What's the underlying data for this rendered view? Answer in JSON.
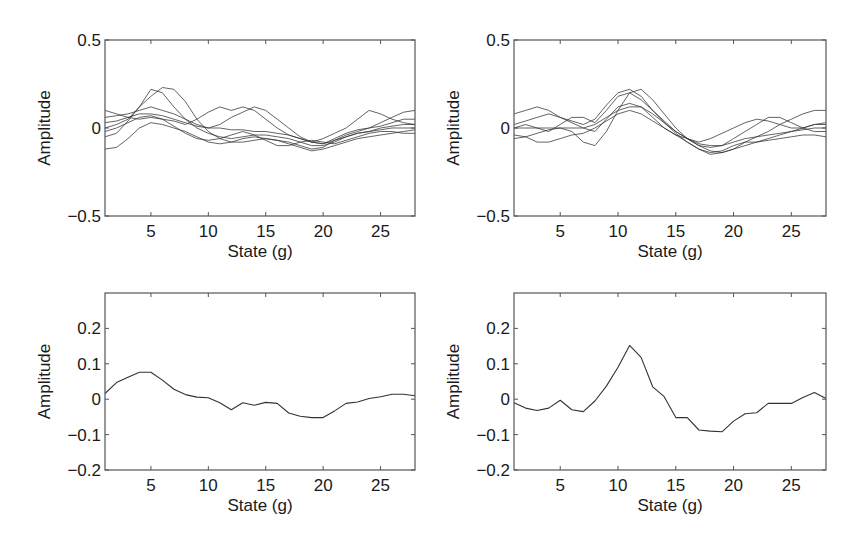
{
  "figure": {
    "panels": [
      {
        "id": "top-left",
        "xlabel": "State (g)",
        "ylabel": "Amplitude"
      },
      {
        "id": "top-right",
        "xlabel": "State (g)",
        "ylabel": "Amplitude"
      },
      {
        "id": "bottom-left",
        "xlabel": "State (g)",
        "ylabel": "Amplitude"
      },
      {
        "id": "bottom-right",
        "xlabel": "State (g)",
        "ylabel": "Amplitude"
      }
    ]
  },
  "chart_data": [
    {
      "type": "line",
      "panel": "top-left",
      "title": "",
      "xlabel": "State (g)",
      "ylabel": "Amplitude",
      "xlim": [
        1,
        28
      ],
      "ylim": [
        -0.5,
        0.5
      ],
      "xticks": [
        5,
        10,
        15,
        20,
        25
      ],
      "yticks": [
        -0.5,
        0,
        0.5
      ],
      "ytick_labels": [
        "−0.5",
        "0",
        "0.5"
      ],
      "grid": false,
      "description": "~25 overlaid individual traces; cluster peaks near state 5 (~0.05-0.22), dips near state 20 (~-0.1)",
      "x": [
        1,
        2,
        3,
        4,
        5,
        6,
        7,
        8,
        9,
        10,
        11,
        12,
        13,
        14,
        15,
        16,
        17,
        18,
        19,
        20,
        21,
        22,
        23,
        24,
        25,
        26,
        27,
        28
      ],
      "series": [
        {
          "name": "trace-1",
          "values": [
            0.03,
            0.04,
            0.06,
            0.08,
            0.08,
            0.07,
            0.05,
            0.03,
            0.01,
            0.0,
            0.0,
            -0.01,
            -0.01,
            -0.02,
            -0.02,
            -0.03,
            -0.04,
            -0.06,
            -0.08,
            -0.09,
            -0.07,
            -0.05,
            -0.03,
            -0.02,
            -0.01,
            0.0,
            0.0,
            0.0
          ]
        },
        {
          "name": "trace-2",
          "values": [
            0.0,
            0.02,
            0.05,
            0.12,
            0.22,
            0.2,
            0.12,
            0.05,
            0.0,
            -0.03,
            -0.05,
            -0.06,
            -0.05,
            -0.04,
            -0.04,
            -0.05,
            -0.06,
            -0.08,
            -0.1,
            -0.1,
            -0.08,
            -0.05,
            -0.03,
            -0.02,
            0.0,
            0.01,
            0.02,
            0.02
          ]
        },
        {
          "name": "trace-3",
          "values": [
            -0.05,
            -0.03,
            0.04,
            0.12,
            0.18,
            0.23,
            0.22,
            0.15,
            0.05,
            -0.02,
            -0.06,
            -0.08,
            -0.08,
            -0.07,
            -0.06,
            -0.07,
            -0.08,
            -0.1,
            -0.12,
            -0.11,
            -0.07,
            -0.04,
            -0.02,
            0.0,
            0.01,
            0.03,
            0.05,
            0.05
          ]
        },
        {
          "name": "trace-4",
          "values": [
            0.1,
            0.08,
            0.06,
            0.05,
            0.06,
            0.05,
            0.04,
            0.02,
            0.05,
            0.09,
            0.12,
            0.1,
            0.12,
            0.1,
            0.05,
            0.0,
            -0.04,
            -0.06,
            -0.08,
            -0.06,
            -0.03,
            0.0,
            0.05,
            0.1,
            0.08,
            0.05,
            0.03,
            0.02
          ]
        },
        {
          "name": "trace-5",
          "values": [
            -0.12,
            -0.11,
            -0.06,
            0.0,
            0.03,
            0.02,
            0.0,
            -0.02,
            -0.05,
            -0.08,
            -0.09,
            -0.08,
            -0.06,
            -0.05,
            -0.06,
            -0.07,
            -0.09,
            -0.11,
            -0.13,
            -0.12,
            -0.1,
            -0.08,
            -0.06,
            -0.05,
            -0.04,
            -0.03,
            -0.02,
            -0.01
          ]
        },
        {
          "name": "trace-6",
          "values": [
            0.06,
            0.07,
            0.08,
            0.1,
            0.12,
            0.1,
            0.08,
            0.05,
            0.02,
            0.0,
            0.02,
            0.06,
            0.09,
            0.12,
            0.1,
            0.05,
            0.0,
            -0.05,
            -0.08,
            -0.09,
            -0.06,
            -0.03,
            -0.01,
            0.0,
            0.03,
            0.06,
            0.09,
            0.1
          ]
        },
        {
          "name": "trace-7",
          "values": [
            -0.02,
            0.0,
            0.03,
            0.06,
            0.07,
            0.05,
            0.01,
            -0.03,
            -0.06,
            -0.07,
            -0.06,
            -0.04,
            -0.02,
            -0.04,
            -0.07,
            -0.1,
            -0.1,
            -0.08,
            -0.07,
            -0.08,
            -0.09,
            -0.07,
            -0.05,
            -0.03,
            -0.02,
            -0.02,
            -0.03,
            -0.03
          ]
        }
      ]
    },
    {
      "type": "line",
      "panel": "top-right",
      "title": "",
      "xlabel": "State (g)",
      "ylabel": "Amplitude",
      "xlim": [
        1,
        28
      ],
      "ylim": [
        -0.5,
        0.5
      ],
      "xticks": [
        5,
        10,
        15,
        20,
        25
      ],
      "yticks": [
        -0.5,
        0,
        0.5
      ],
      "ytick_labels": [
        "−0.5",
        "0",
        "0.5"
      ],
      "grid": false,
      "description": "~25 overlaid individual traces; cluster peaks near state 11 (~0.1-0.22), dips near state 18-19 (~-0.1 to -0.15)",
      "x": [
        1,
        2,
        3,
        4,
        5,
        6,
        7,
        8,
        9,
        10,
        11,
        12,
        13,
        14,
        15,
        16,
        17,
        18,
        19,
        20,
        21,
        22,
        23,
        24,
        25,
        26,
        27,
        28
      ],
      "series": [
        {
          "name": "trace-1",
          "values": [
            0.0,
            0.0,
            0.0,
            0.0,
            0.0,
            0.0,
            0.0,
            0.02,
            0.06,
            0.1,
            0.12,
            0.12,
            0.08,
            0.03,
            -0.02,
            -0.06,
            -0.09,
            -0.1,
            -0.1,
            -0.08,
            -0.06,
            -0.05,
            -0.04,
            -0.03,
            -0.02,
            -0.01,
            0.0,
            0.0
          ]
        },
        {
          "name": "trace-2",
          "values": [
            0.08,
            0.1,
            0.12,
            0.1,
            0.06,
            0.04,
            0.02,
            0.05,
            0.13,
            0.2,
            0.22,
            0.18,
            0.1,
            0.03,
            -0.03,
            -0.08,
            -0.12,
            -0.15,
            -0.14,
            -0.12,
            -0.1,
            -0.08,
            -0.06,
            -0.04,
            -0.02,
            0.0,
            0.02,
            0.02
          ]
        },
        {
          "name": "trace-3",
          "values": [
            -0.06,
            -0.05,
            -0.03,
            -0.01,
            0.0,
            -0.02,
            -0.08,
            -0.1,
            -0.02,
            0.1,
            0.2,
            0.22,
            0.16,
            0.08,
            0.0,
            -0.06,
            -0.1,
            -0.13,
            -0.14,
            -0.12,
            -0.08,
            -0.05,
            -0.02,
            0.02,
            0.05,
            0.08,
            0.1,
            0.1
          ]
        },
        {
          "name": "trace-4",
          "values": [
            0.02,
            0.04,
            0.06,
            0.08,
            0.06,
            0.03,
            0.0,
            -0.02,
            0.05,
            0.12,
            0.14,
            0.12,
            0.06,
            0.0,
            -0.04,
            -0.06,
            -0.08,
            -0.06,
            -0.03,
            0.0,
            0.03,
            0.05,
            0.04,
            0.02,
            0.0,
            0.0,
            0.02,
            0.03
          ]
        },
        {
          "name": "trace-5",
          "values": [
            -0.04,
            -0.05,
            -0.08,
            -0.08,
            -0.06,
            -0.04,
            -0.03,
            0.0,
            0.04,
            0.08,
            0.1,
            0.08,
            0.04,
            0.0,
            -0.04,
            -0.08,
            -0.12,
            -0.14,
            -0.13,
            -0.1,
            -0.08,
            -0.08,
            -0.07,
            -0.06,
            -0.05,
            -0.04,
            -0.04,
            -0.05
          ]
        },
        {
          "name": "trace-6",
          "values": [
            0.0,
            0.02,
            0.0,
            -0.02,
            0.02,
            0.06,
            0.06,
            0.03,
            0.1,
            0.18,
            0.2,
            0.16,
            0.1,
            0.04,
            -0.02,
            -0.06,
            -0.1,
            -0.11,
            -0.1,
            -0.06,
            -0.02,
            0.02,
            0.06,
            0.06,
            0.03,
            0.0,
            -0.02,
            -0.02
          ]
        }
      ]
    },
    {
      "type": "line",
      "panel": "bottom-left",
      "title": "",
      "xlabel": "State (g)",
      "ylabel": "Amplitude",
      "xlim": [
        1,
        28
      ],
      "ylim": [
        -0.2,
        0.3
      ],
      "xticks": [
        5,
        10,
        15,
        20,
        25
      ],
      "yticks": [
        -0.2,
        -0.1,
        0,
        0.1,
        0.2
      ],
      "ytick_labels": [
        "−0.2",
        "−0.1",
        "0",
        "0.1",
        "0.2"
      ],
      "grid": false,
      "x": [
        1,
        2,
        3,
        4,
        5,
        6,
        7,
        8,
        9,
        10,
        11,
        12,
        13,
        14,
        15,
        16,
        17,
        18,
        19,
        20,
        21,
        22,
        23,
        24,
        25,
        26,
        27,
        28
      ],
      "series": [
        {
          "name": "mean",
          "values": [
            0.016,
            0.047,
            0.062,
            0.076,
            0.076,
            0.054,
            0.028,
            0.013,
            0.006,
            0.004,
            -0.01,
            -0.03,
            -0.01,
            -0.017,
            -0.009,
            -0.012,
            -0.039,
            -0.048,
            -0.052,
            -0.052,
            -0.033,
            -0.012,
            -0.008,
            0.002,
            0.007,
            0.014,
            0.014,
            0.01
          ]
        }
      ]
    },
    {
      "type": "line",
      "panel": "bottom-right",
      "title": "",
      "xlabel": "State (g)",
      "ylabel": "Amplitude",
      "xlim": [
        1,
        28
      ],
      "ylim": [
        -0.2,
        0.3
      ],
      "xticks": [
        5,
        10,
        15,
        20,
        25
      ],
      "yticks": [
        -0.2,
        -0.1,
        0,
        0.1,
        0.2
      ],
      "ytick_labels": [
        "−0.2",
        "−0.1",
        "0",
        "0.1",
        "0.2"
      ],
      "grid": false,
      "x": [
        1,
        2,
        3,
        4,
        5,
        6,
        7,
        8,
        9,
        10,
        11,
        12,
        13,
        14,
        15,
        16,
        17,
        18,
        19,
        20,
        21,
        22,
        23,
        24,
        25,
        26,
        27,
        28
      ],
      "series": [
        {
          "name": "mean",
          "values": [
            -0.01,
            -0.025,
            -0.032,
            -0.025,
            -0.003,
            -0.03,
            -0.035,
            -0.005,
            0.037,
            0.09,
            0.152,
            0.118,
            0.035,
            0.007,
            -0.052,
            -0.052,
            -0.087,
            -0.09,
            -0.092,
            -0.062,
            -0.041,
            -0.038,
            -0.012,
            -0.012,
            -0.012,
            0.005,
            0.019,
            0.002
          ]
        }
      ]
    }
  ]
}
